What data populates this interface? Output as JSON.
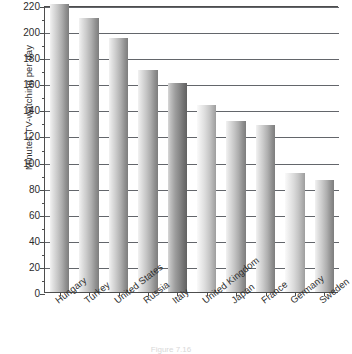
{
  "chart_data": {
    "type": "bar",
    "title": "",
    "xlabel": "",
    "ylabel": "Minutes TV-watching per day",
    "ylim": [
      0,
      220
    ],
    "ytick_step": 20,
    "minor_tick_step": 10,
    "grid": "horizontal",
    "legend": "none",
    "orientation": "vertical",
    "categories": [
      "Hungary",
      "Turkey",
      "United States",
      "Russia",
      "Italy",
      "United Kingdom",
      "Japan",
      "France",
      "Germany",
      "Sweden"
    ],
    "values": [
      221,
      210,
      195,
      170,
      160,
      143,
      131,
      128,
      91,
      86
    ],
    "yticks": [
      0,
      20,
      40,
      60,
      80,
      100,
      120,
      140,
      160,
      180,
      200,
      220
    ],
    "ytick_labels": [
      "0",
      "20",
      "40",
      "60",
      "80",
      "100",
      "120",
      "140",
      "160",
      "180",
      "200",
      "220"
    ],
    "bar_shading": [
      "normal",
      "normal",
      "normal",
      "normal",
      "dark",
      "light",
      "normal",
      "normal",
      "light",
      "normal"
    ],
    "colors": {
      "bar_gradient_light": "#f2f2f2",
      "bar_gradient_dark": "#7d7d7d",
      "gridline": "#63666b",
      "axis": "#4d4d4d",
      "text": "#2b2b2b",
      "background": "#ffffff"
    }
  },
  "caption": {
    "text": "Figure 7.16"
  }
}
